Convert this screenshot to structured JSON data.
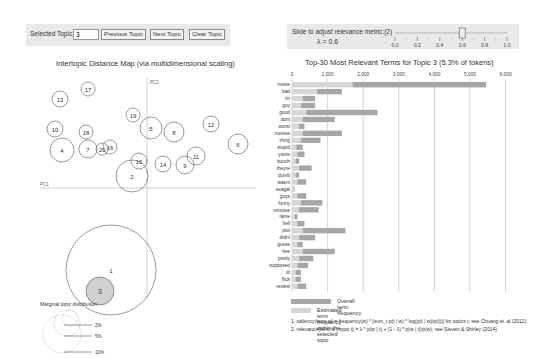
{
  "controls": {
    "selected_topic_label": "Selected Topic:",
    "selected_topic_value": "3",
    "previous_label": "Previous Topic",
    "next_label": "Next Topic",
    "clear_label": "Clear Topic"
  },
  "relevance": {
    "slider_label": "Slide to adjust relevance metric:(2)",
    "lambda_text": "λ = 0.6",
    "lambda_value": 0.6,
    "ticks": [
      "0.0",
      "0.2",
      "0.4",
      "0.6",
      "0.8",
      "1.0"
    ]
  },
  "map": {
    "title": "Intertopic Distance Map (via multidimensional scaling)",
    "pc1_label": "PC1",
    "pc2_label": "PC2",
    "selected_color": "#cccccc",
    "topics": [
      {
        "id": "1",
        "x": 111,
        "y": 200,
        "r": 45
      },
      {
        "id": "2",
        "x": 132,
        "y": 106,
        "r": 16
      },
      {
        "id": "3",
        "x": 100,
        "y": 221,
        "r": 14
      },
      {
        "id": "4",
        "x": 62,
        "y": 80,
        "r": 12
      },
      {
        "id": "5",
        "x": 151,
        "y": 58,
        "r": 11
      },
      {
        "id": "6",
        "x": 238,
        "y": 74,
        "r": 10
      },
      {
        "id": "7",
        "x": 88,
        "y": 79,
        "r": 9
      },
      {
        "id": "8",
        "x": 174,
        "y": 62,
        "r": 10
      },
      {
        "id": "9",
        "x": 185,
        "y": 95,
        "r": 9
      },
      {
        "id": "10",
        "x": 55,
        "y": 59,
        "r": 8
      },
      {
        "id": "11",
        "x": 196,
        "y": 86,
        "r": 9
      },
      {
        "id": "12",
        "x": 211,
        "y": 54,
        "r": 8
      },
      {
        "id": "13",
        "x": 60,
        "y": 29,
        "r": 8
      },
      {
        "id": "14",
        "x": 163,
        "y": 94,
        "r": 8
      },
      {
        "id": "15",
        "x": 139,
        "y": 91,
        "r": 8
      },
      {
        "id": "16",
        "x": 110,
        "y": 77,
        "r": 7
      },
      {
        "id": "17",
        "x": 88,
        "y": 19,
        "r": 7
      },
      {
        "id": "18",
        "x": 86,
        "y": 62,
        "r": 7
      },
      {
        "id": "19",
        "x": 133,
        "y": 45,
        "r": 7
      },
      {
        "id": "20",
        "x": 102,
        "y": 79,
        "r": 6
      }
    ],
    "marginal_title": "Marginal topic distribution",
    "marginal_labels": [
      "2%",
      "5%",
      "10%"
    ]
  },
  "bars": {
    "title": "Top-30 Most Relevant Terms for Topic 3 (5.3% of tokens)",
    "axis_ticks": [
      "0",
      "1,000",
      "2,000",
      "3,000",
      "4,000",
      "5,000",
      "6,000"
    ],
    "overall_color": "#a6a6a6",
    "estimated_color": "#d6d6d6",
    "legend_overall": "Overall term frequency",
    "legend_estimated": "Estimated term frequency within the selected topic",
    "footnote1": "1. saliency(term w) = frequency(w) * [sum_t p(t | w) * log(p(t | w)/p(t))] for topics t; see Chuang et. al (2012)",
    "footnote2": "2. relevance(term w | topic t) = λ * p(w | t) + (1 - λ) * p(w | t)/p(w); see Sievert & Shirley (2014)"
  },
  "chart_data": {
    "type": "bar",
    "title": "Top-30 Most Relevant Terms for Topic 3 (5.3% of tokens)",
    "xlim": [
      0,
      6000
    ],
    "categories": [
      "movie",
      "bad",
      "im",
      "guy",
      "good",
      "dont",
      "worst",
      "movies",
      "thing",
      "stupid",
      "youre",
      "bunch",
      "theyre",
      "dumb",
      "wasnt",
      "seagal",
      "guys",
      "funny",
      "minutes",
      "lame",
      "hell",
      "plot",
      "didnt",
      "guess",
      "hes",
      "pretty",
      "supposed",
      "id",
      "flick",
      "review"
    ],
    "series": [
      {
        "name": "Overall term frequency",
        "values": [
          5450,
          1400,
          650,
          650,
          2400,
          1200,
          350,
          1400,
          800,
          300,
          350,
          200,
          550,
          200,
          400,
          80,
          400,
          850,
          750,
          150,
          350,
          1500,
          650,
          300,
          1200,
          600,
          450,
          250,
          250,
          400
        ]
      },
      {
        "name": "Estimated term frequency within the selected topic",
        "values": [
          1700,
          700,
          300,
          250,
          400,
          300,
          200,
          300,
          250,
          120,
          150,
          100,
          200,
          100,
          150,
          60,
          150,
          250,
          200,
          80,
          150,
          300,
          200,
          150,
          300,
          200,
          150,
          100,
          100,
          150
        ]
      }
    ]
  }
}
